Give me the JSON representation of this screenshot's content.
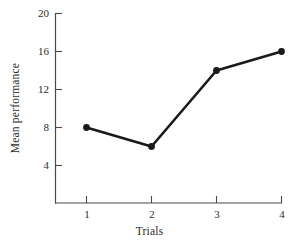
{
  "chart_data": {
    "type": "line",
    "title": "",
    "xlabel": "Trials",
    "ylabel": "Mean performance",
    "categories": [
      "1",
      "2",
      "3",
      "4"
    ],
    "x": [
      1,
      2,
      3,
      4
    ],
    "values": [
      8,
      6,
      14,
      16
    ],
    "series": [
      {
        "name": "Mean performance",
        "values": [
          8,
          6,
          14,
          16
        ]
      }
    ],
    "xlim": [
      0.7,
      4.0
    ],
    "ylim": [
      2.0,
      20.0
    ],
    "xticks": [
      "1",
      "2",
      "3",
      "4"
    ],
    "yticks": [
      "4",
      "8",
      "12",
      "16",
      "20"
    ],
    "ytick_values": [
      4,
      8,
      12,
      16,
      20
    ],
    "grid": false,
    "legend": false,
    "marker": "filled-circle",
    "line_color": "#1a1a1a",
    "marker_color": "#1a1a1a",
    "axis_color": "#4a4a4a",
    "background": "#ffffff"
  },
  "axes": {
    "y_ticks": [
      {
        "label": "20",
        "value": 20
      },
      {
        "label": "16",
        "value": 16
      },
      {
        "label": "12",
        "value": 12
      },
      {
        "label": "8",
        "value": 8
      },
      {
        "label": "4",
        "value": 4
      }
    ],
    "x_ticks": [
      {
        "label": "1",
        "value": 1
      },
      {
        "label": "2",
        "value": 2
      },
      {
        "label": "3",
        "value": 3
      },
      {
        "label": "4",
        "value": 4
      }
    ],
    "x_axis_title": "Trials",
    "y_axis_title": "Mean performance"
  }
}
